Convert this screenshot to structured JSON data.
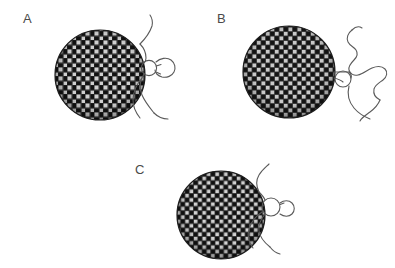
{
  "figure": {
    "width": 395,
    "height": 268,
    "background_color": "#ffffff",
    "caption_letters": [
      "A",
      "B",
      "C"
    ]
  },
  "panels": [
    {
      "id": "panel-a",
      "label": "A",
      "label_x": 23,
      "label_y": 12,
      "disc": {
        "cx": 100,
        "cy": 75,
        "r": 45,
        "fill_description": "woven-mesh-texture",
        "base_color": "#2b2b2b",
        "weave_light_color": "#d8d8d8",
        "outline_color": "#1a1a1a"
      },
      "ring": {
        "cx": 149,
        "cy": 68,
        "r": 7.5,
        "stroke_color": "#555555"
      },
      "attachment": "ring-touching-disc-edge-with-lobe",
      "tails": 2
    },
    {
      "id": "panel-b",
      "label": "B",
      "label_x": 217,
      "label_y": 12,
      "disc": {
        "cx": 289,
        "cy": 72,
        "r": 46,
        "fill_description": "woven-mesh-texture",
        "base_color": "#2b2b2b",
        "weave_light_color": "#d8d8d8",
        "outline_color": "#1a1a1a"
      },
      "ring": {
        "cx": 342,
        "cy": 79,
        "r": 8,
        "stroke_color": "#555555"
      },
      "attachment": "ring-detached-linked-by-short-stem",
      "tails": 2
    },
    {
      "id": "panel-c",
      "label": "C",
      "label_x": 135,
      "label_y": 163,
      "disc": {
        "cx": 221,
        "cy": 215,
        "r": 44,
        "fill_description": "woven-mesh-texture",
        "base_color": "#2b2b2b",
        "weave_light_color": "#d8d8d8",
        "outline_color": "#1a1a1a"
      },
      "ring": {
        "cx": 271,
        "cy": 207,
        "r": 9,
        "stroke_color": "#555555"
      },
      "attachment": "ring-touching-disc-edge",
      "tails": 2
    }
  ],
  "colors": {
    "background": "#ffffff",
    "disc_dark": "#2b2b2b",
    "disc_light": "#d8d8d8",
    "line": "#555555",
    "label_text": "#4a4a4a"
  }
}
